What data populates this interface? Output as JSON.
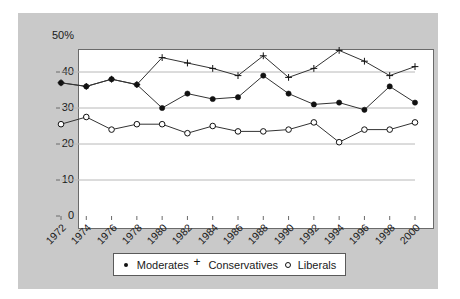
{
  "chart_data": {
    "type": "line",
    "title": "",
    "subtitle": "",
    "xlabel": "",
    "ylabel": "",
    "xlim": [
      1972,
      2000
    ],
    "ylim": [
      0,
      50
    ],
    "yticks": [
      "50%",
      "40",
      "30",
      "20",
      "10",
      "0"
    ],
    "ytick_values": [
      50,
      40,
      30,
      20,
      10,
      0
    ],
    "grid": "horizontal",
    "legend_position": "bottom-center",
    "categories": [
      "1972",
      "1974",
      "1976",
      "1978",
      "1980",
      "1982",
      "1984",
      "1986",
      "1988",
      "1990",
      "1992",
      "1994",
      "1996",
      "1998",
      "2000"
    ],
    "series": [
      {
        "name": "Moderates",
        "marker": "filled-circle",
        "values": [
          37,
          36,
          38,
          36.5,
          30,
          34,
          32.5,
          33,
          39,
          34,
          31,
          31.5,
          29.5,
          36,
          31.5
        ]
      },
      {
        "name": "Conservatives",
        "marker": "plus",
        "values": [
          37,
          36,
          38,
          36.5,
          44,
          42.5,
          41,
          39,
          44.5,
          38.5,
          41,
          46,
          43,
          39,
          41.5
        ]
      },
      {
        "name": "Liberals",
        "marker": "open-circle",
        "values": [
          25.5,
          27.5,
          24,
          25.5,
          25.5,
          23,
          25,
          23.5,
          23.5,
          24,
          26,
          20.5,
          24,
          24,
          26
        ]
      }
    ]
  },
  "legend": {
    "entries": [
      {
        "label": "Moderates",
        "marker": "filled-circle-marker"
      },
      {
        "label": "Conservatives",
        "marker": "plus-marker"
      },
      {
        "label": "Liberals",
        "marker": "open-circle-marker"
      }
    ]
  },
  "colors": {
    "panel_background": "#c9c9c9",
    "plot_background": "#ffffff",
    "axis": "#6a6a6a",
    "gridline": "#b8b8b8",
    "series_line": "#333333",
    "text": "#1a1a1a"
  }
}
